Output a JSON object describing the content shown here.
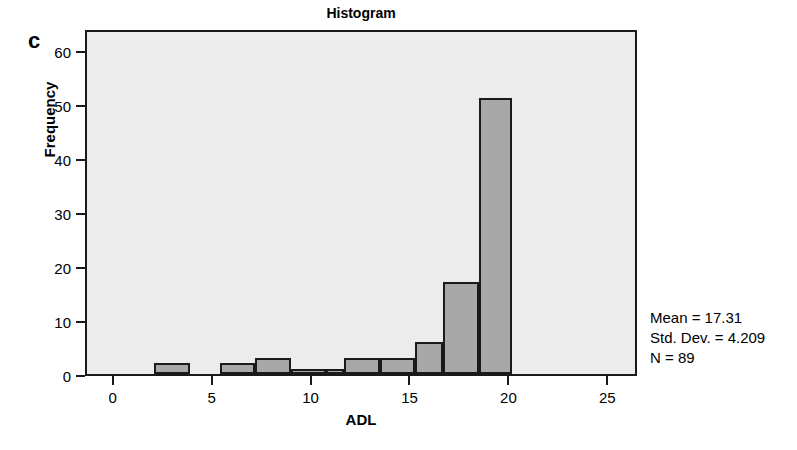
{
  "figure": {
    "panel_label": "c",
    "background_color": "#ffffff"
  },
  "chart_data": {
    "type": "bar",
    "title": "Histogram",
    "xlabel": "ADL",
    "ylabel": "Frequency",
    "xlim": [
      -1.4,
      26.5
    ],
    "ylim": [
      0,
      64
    ],
    "xticks": [
      0,
      5,
      10,
      15,
      20,
      25
    ],
    "yticks": [
      0,
      10,
      20,
      30,
      40,
      50,
      60
    ],
    "grid": false,
    "legend": "none",
    "plot_background_color": "#ececec",
    "bar_fill_color": "#a8a8a8",
    "bar_edge_color": "#1a1a1a",
    "bin_width": 1.8,
    "bins": [
      {
        "left": 2.0,
        "right": 3.8,
        "center": 2.9,
        "value": 2
      },
      {
        "left": 5.3,
        "right": 7.1,
        "center": 6.2,
        "value": 2
      },
      {
        "left": 7.1,
        "right": 8.9,
        "center": 8.0,
        "value": 3
      },
      {
        "left": 8.9,
        "right": 10.7,
        "center": 9.8,
        "value": 1
      },
      {
        "left": 10.7,
        "right": 11.6,
        "center": 11.2,
        "value": 1
      },
      {
        "left": 11.6,
        "right": 13.4,
        "center": 12.5,
        "value": 3
      },
      {
        "left": 13.4,
        "right": 15.2,
        "center": 14.3,
        "value": 3
      },
      {
        "left": 15.2,
        "right": 16.6,
        "center": 15.9,
        "value": 6
      },
      {
        "left": 16.6,
        "right": 18.4,
        "center": 17.5,
        "value": 17
      },
      {
        "left": 18.4,
        "right": 20.1,
        "center": 19.2,
        "value": 51
      }
    ],
    "categories": [
      "2.9",
      "6.2",
      "8.0",
      "9.8",
      "11.2",
      "12.5",
      "14.3",
      "15.9",
      "17.5",
      "19.2"
    ],
    "values": [
      2,
      2,
      3,
      1,
      1,
      3,
      3,
      6,
      17,
      51
    ],
    "annotations": {
      "mean": "Mean = 17.31",
      "std_dev": "Std. Dev. = 4.209",
      "n": "N = 89"
    }
  },
  "stats": {
    "mean_label": "Mean = 17.31",
    "std_label": "Std. Dev. = 4.209",
    "n_label": "N = 89"
  },
  "ytick_labels": [
    "0",
    "10",
    "20",
    "30",
    "40",
    "50",
    "60"
  ],
  "xtick_labels": [
    "0",
    "5",
    "10",
    "15",
    "20",
    "25"
  ]
}
